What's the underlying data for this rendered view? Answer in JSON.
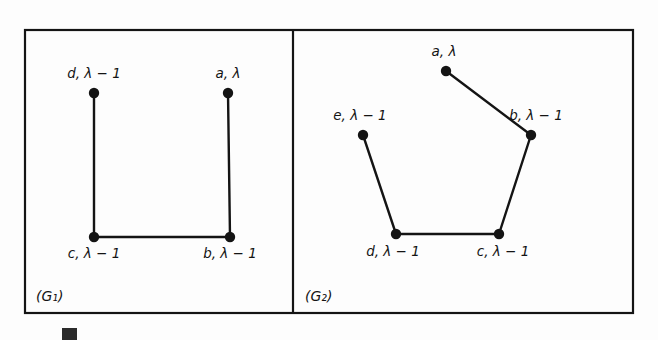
{
  "figure": {
    "domain": "Diagram",
    "background_color": "#ffffff",
    "stroke_color": "#141414",
    "border": {
      "x": 25,
      "y": 30,
      "width": 608,
      "height": 283,
      "stroke_width": 2.2
    },
    "divider": {
      "x": 293,
      "y1": 30,
      "y2": 313,
      "stroke_width": 2.2
    },
    "vertex_radius": 5.2,
    "edge_width": 2.4
  },
  "panels": [
    {
      "id": "G1",
      "label": "(G₁)",
      "label_x": 36,
      "label_y": 301,
      "nodes": [
        {
          "id": "d",
          "label": "d, λ − 1",
          "cx": 94,
          "cy": 93,
          "label_x": 94,
          "label_y": 78,
          "anchor": "middle"
        },
        {
          "id": "a",
          "label": "a, λ",
          "cx": 228,
          "cy": 93,
          "label_x": 228,
          "label_y": 78,
          "anchor": "middle"
        },
        {
          "id": "c",
          "label": "c, λ − 1",
          "cx": 94,
          "cy": 237,
          "label_x": 94,
          "label_y": 258,
          "anchor": "middle"
        },
        {
          "id": "b",
          "label": "b, λ − 1",
          "cx": 230,
          "cy": 237,
          "label_x": 230,
          "label_y": 258,
          "anchor": "middle"
        }
      ],
      "edges": [
        {
          "from": "d",
          "to": "c"
        },
        {
          "from": "c",
          "to": "b"
        },
        {
          "from": "b",
          "to": "a"
        }
      ]
    },
    {
      "id": "G2",
      "label": "(G₂)",
      "label_x": 305,
      "label_y": 301,
      "nodes": [
        {
          "id": "a",
          "label": "a, λ",
          "cx": 446,
          "cy": 71,
          "label_x": 444,
          "label_y": 56,
          "anchor": "middle"
        },
        {
          "id": "e",
          "label": "e, λ − 1",
          "cx": 363,
          "cy": 135,
          "label_x": 360,
          "label_y": 120,
          "anchor": "middle"
        },
        {
          "id": "b",
          "label": "b, λ − 1",
          "cx": 531,
          "cy": 135,
          "label_x": 536,
          "label_y": 120,
          "anchor": "middle"
        },
        {
          "id": "d",
          "label": "d, λ − 1",
          "cx": 396,
          "cy": 234,
          "label_x": 393,
          "label_y": 256,
          "anchor": "middle"
        },
        {
          "id": "c",
          "label": "c, λ − 1",
          "cx": 499,
          "cy": 234,
          "label_x": 503,
          "label_y": 256,
          "anchor": "middle"
        }
      ],
      "edges": [
        {
          "from": "a",
          "to": "b"
        },
        {
          "from": "b",
          "to": "c"
        },
        {
          "from": "c",
          "to": "d"
        },
        {
          "from": "d",
          "to": "e"
        }
      ]
    }
  ],
  "caption": {
    "marker_color": "#2b2b2b",
    "text": "",
    "visible_fragment": true
  }
}
